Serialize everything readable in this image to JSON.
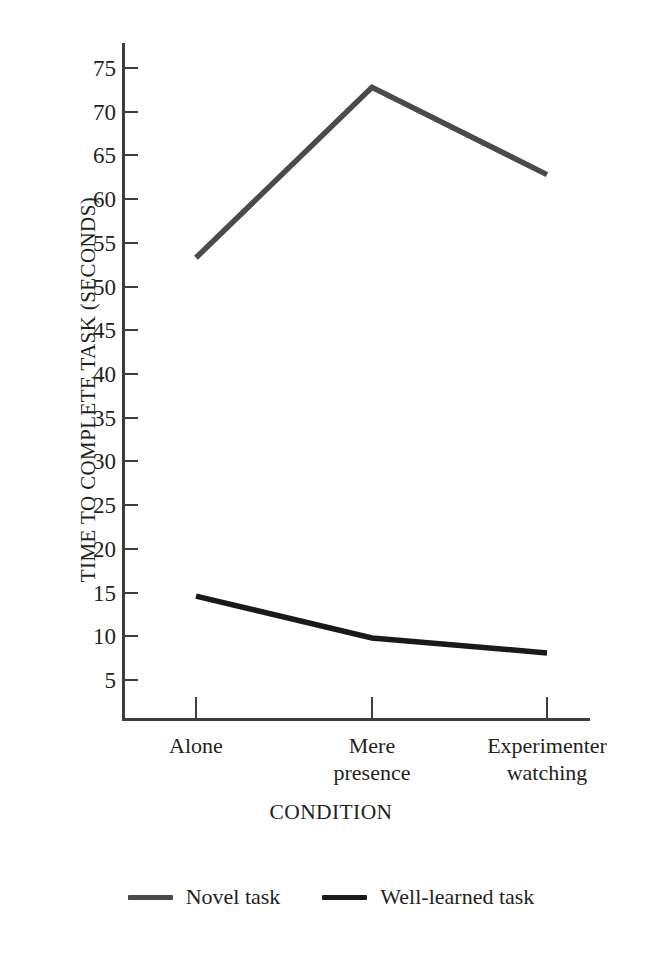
{
  "chart_data": {
    "type": "line",
    "title": "",
    "xlabel": "CONDITION",
    "ylabel": "TIME TO COMPLETE TASK (SECONDS)",
    "categories": [
      "Alone",
      "Mere presence",
      "Experimenter watching"
    ],
    "ylim": [
      0,
      77.5
    ],
    "yticks": [
      75,
      70,
      65,
      60,
      55,
      50,
      45,
      40,
      35,
      30,
      25,
      20,
      15,
      10,
      5
    ],
    "grid": false,
    "legend_position": "bottom",
    "series": [
      {
        "name": "Novel task",
        "color": "#4a4a4a",
        "values": [
          53.3,
          72.8,
          62.8
        ]
      },
      {
        "name": "Well-learned task",
        "color": "#1a1a1a",
        "values": [
          14.6,
          9.8,
          8.1
        ]
      }
    ]
  },
  "axes": {
    "y_title": "TIME TO COMPLETE TASK (SECONDS)",
    "x_title": "CONDITION",
    "y_tick_labels": [
      "75",
      "70",
      "65",
      "60",
      "55",
      "50",
      "45",
      "40",
      "35",
      "30",
      "25",
      "20",
      "15",
      "10",
      "5"
    ],
    "x_tick_labels": [
      "Alone",
      "Mere\npresence",
      "Experimenter\nwatching"
    ],
    "x_tick_labels_line1": [
      "Alone",
      "Mere",
      "Experimenter"
    ],
    "x_tick_labels_line2": [
      "",
      "presence",
      "watching"
    ]
  },
  "legend": {
    "items": [
      {
        "label": "Novel task",
        "color": "#4a4a4a"
      },
      {
        "label": "Well-learned task",
        "color": "#1a1a1a"
      }
    ]
  },
  "colors": {
    "axis": "#3d3d3d",
    "text": "#231f20",
    "background": "#ffffff",
    "novel_task_line": "#4a4a4a",
    "well_learned_line": "#1a1a1a"
  }
}
